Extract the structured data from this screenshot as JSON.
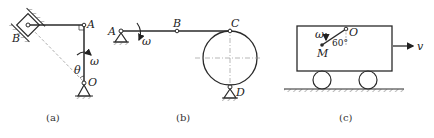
{
  "figure_a": {
    "caption": "(a)",
    "labels": {
      "A": "A",
      "B": "B",
      "O": "O",
      "omega": "ω",
      "theta": "θ"
    },
    "description": "Crank OA rotating with ω about pivot O, horizontal rod from A to slider B in inclined guide; angle θ between OA and line OB"
  },
  "figure_b": {
    "caption": "(b)",
    "labels": {
      "A": "A",
      "B": "B",
      "C": "C",
      "D": "D",
      "omega": "ω"
    },
    "description": "Rod AC pivoted at A rotating with ω, point B on rod, C connected to top of disk pinned at D"
  },
  "figure_c": {
    "caption": "(c)",
    "labels": {
      "O": "O",
      "M": "M",
      "omega": "ω",
      "angle": "60°",
      "v": "v"
    },
    "description": "Cart moving with velocity v, rod OM rotating with ω inside cart at 60° to vertical"
  },
  "colors": {
    "line": "#2a2a2a",
    "dash": "#9a9a9a",
    "text": "#222222"
  }
}
